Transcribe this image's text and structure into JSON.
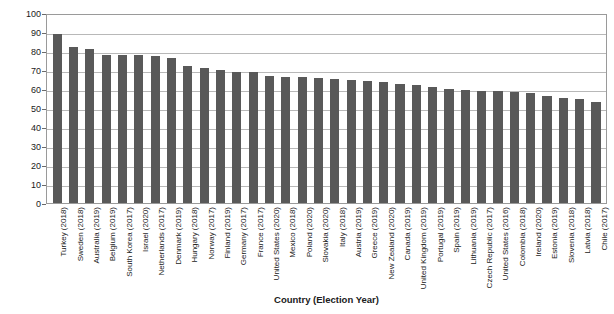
{
  "chart_data": {
    "type": "bar",
    "title": "",
    "xlabel": "Country (Election Year)",
    "ylabel": "Voter Turnout (% of Voting Age Population)",
    "ylim": [
      0,
      100
    ],
    "ytick_step": 10,
    "yticks": [
      0,
      10,
      20,
      30,
      40,
      50,
      60,
      70,
      80,
      90,
      100
    ],
    "grid": true,
    "legend": false,
    "bar_color": "#595959",
    "categories": [
      "Turkey (2018)",
      "Sweden (2018)",
      "Australia (2019)",
      "Belgium (2019)",
      "South Korea (2017)",
      "Israel (2020)",
      "Netherlands (2017)",
      "Denmark (2019)",
      "Hungary (2018)",
      "Norway (2017)",
      "Finland (2019)",
      "Germany (2017)",
      "France (2017)",
      "United States (2020)",
      "Mexico (2018)",
      "Poland (2020)",
      "Slovakia (2020)",
      "Italy (2018)",
      "Austria (2019)",
      "Greece (2019)",
      "New Zealand (2020)",
      "Canada (2019)",
      "United Kingdom (2019)",
      "Portugal (2019)",
      "Spain (2019)",
      "Lithuania (2019)",
      "Czech Republic (2017)",
      "United States (2016)",
      "Colombia (2018)",
      "Ireland (2020)",
      "Estonia (2019)",
      "Slovenia (2018)",
      "Latvia (2018)",
      "Chile (2017)"
    ],
    "values": [
      89.0,
      82.1,
      80.8,
      77.9,
      77.9,
      78.0,
      77.5,
      76.5,
      72.1,
      70.9,
      70.0,
      69.1,
      68.7,
      66.8,
      66.4,
      66.2,
      66.0,
      65.1,
      64.8,
      64.2,
      63.8,
      62.7,
      62.3,
      61.0,
      60.0,
      59.3,
      59.1,
      58.8,
      58.3,
      58.1,
      56.3,
      55.1,
      54.6,
      53.0
    ]
  },
  "axes": {
    "ytitle": "Voter Turnout (% of Voting Age Population)",
    "xtitle": "Country (Election Year)"
  }
}
